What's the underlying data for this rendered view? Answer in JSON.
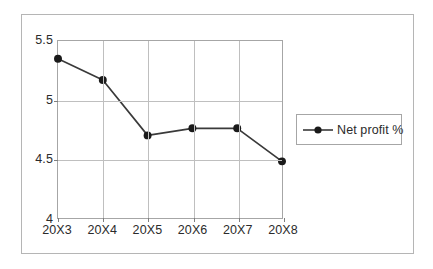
{
  "chart_data": {
    "type": "line",
    "title": "",
    "xlabel": "",
    "ylabel": "",
    "categories": [
      "20X3",
      "20X4",
      "20X5",
      "20X6",
      "20X7",
      "20X8"
    ],
    "series": [
      {
        "name": "Net profit %",
        "values": [
          5.35,
          5.17,
          4.7,
          4.76,
          4.76,
          4.48
        ]
      }
    ],
    "ylim": [
      4,
      5.5
    ],
    "yticks": [
      4,
      4.5,
      5,
      5.5
    ],
    "ytick_labels": [
      "4",
      "4.5",
      "5",
      "5.5"
    ],
    "grid": "both",
    "legend_position": "right",
    "marker": "circle",
    "line_color": "#3a3a3a",
    "marker_color": "#1a1a1a",
    "grid_color": "#bfbfbf",
    "frame_color": "#a6a6a6",
    "text_color": "#2b2b2b"
  },
  "legend": {
    "label": "Net profit %"
  }
}
